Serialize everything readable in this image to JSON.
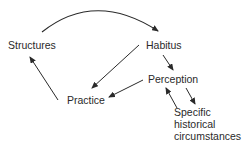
{
  "diagram": {
    "nodes": {
      "structures": "Structures",
      "habitus": "Habitus",
      "perception": "Perception",
      "practice": "Practice",
      "specific_line1": "Specific",
      "specific_line2": "historical",
      "specific_line3": "circumstances"
    },
    "edges": [
      {
        "from": "Structures",
        "to": "Habitus",
        "style": "curved-arc"
      },
      {
        "from": "Habitus",
        "to": "Practice"
      },
      {
        "from": "Habitus",
        "to": "Perception"
      },
      {
        "from": "Perception",
        "to": "Practice"
      },
      {
        "from": "Practice",
        "to": "Structures"
      },
      {
        "from": "Specific historical circumstances",
        "to": "Perception"
      },
      {
        "from": "Perception",
        "to": "Specific historical circumstances"
      }
    ],
    "colors": {
      "line": "#2a2a2a",
      "text": "#2a2a2a",
      "background": "#ffffff"
    }
  }
}
